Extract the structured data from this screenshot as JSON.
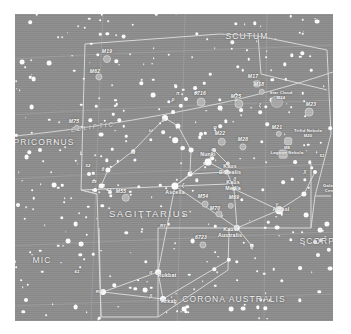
{
  "chart_data": {
    "type": "scatter",
    "subtitle": "",
    "xlabel": "",
    "ylabel": "",
    "grid": true,
    "legend": "none",
    "colors": {
      "sky_background": "#8d8d8d",
      "page_background": "#ffffff",
      "star": "#ffffff",
      "deep_sky_object": "#b4b4b4",
      "boundary_line": "#d8d8d8",
      "constellation_line": "#e4e4e4",
      "grid_line": "#a3a3a3",
      "label_text": "#ffffff"
    },
    "constellation_names": [
      {
        "name": "SCUTUM",
        "x": 232,
        "y": 22,
        "size": "normal"
      },
      {
        "name": "SAGITTARIUS",
        "x": 134,
        "y": 200,
        "size": "big"
      },
      {
        "name": "CAPRICORNUS",
        "x": 22,
        "y": 128,
        "size": "normal"
      },
      {
        "name": "MIC",
        "x": 27,
        "y": 246,
        "size": "normal"
      },
      {
        "name": "SCORPIUS",
        "x": 311,
        "y": 227,
        "size": "normal"
      },
      {
        "name": "CORONA AUSTRALIS",
        "x": 219,
        "y": 285,
        "size": "normal"
      }
    ],
    "ecliptic_label": "ECLIPTIC",
    "named_stars": [
      {
        "name": "Nunki",
        "x": 193,
        "y": 141
      },
      {
        "name": "Ascella",
        "x": 160,
        "y": 179
      },
      {
        "name": "Alnasl",
        "x": 266,
        "y": 196
      },
      {
        "name": "Rukbat",
        "x": 152,
        "y": 262
      },
      {
        "name": "Arkab",
        "x": 154,
        "y": 288
      },
      {
        "name": "Kaus Borealis",
        "x": 215,
        "y": 156
      },
      {
        "name": "Kaus Media",
        "x": 218,
        "y": 172
      },
      {
        "name": "Kaus Australis",
        "x": 215,
        "y": 219
      }
    ],
    "deep_sky_objects": [
      {
        "name": "M19",
        "x": 92,
        "y": 45,
        "type": "globular-cluster",
        "r": 3.0
      },
      {
        "name": "M62",
        "x": 84,
        "y": 63,
        "type": "globular-cluster",
        "r": 2.6
      },
      {
        "name": "M75",
        "x": 62,
        "y": 114,
        "type": "globular-cluster",
        "r": 2.2
      },
      {
        "name": "6716",
        "x": 186,
        "y": 88,
        "type": "open-cluster",
        "r": 3.4
      },
      {
        "name": "M25",
        "x": 224,
        "y": 90,
        "type": "open-cluster",
        "r": 3.6
      },
      {
        "name": "M17",
        "x": 242,
        "y": 70,
        "type": "nebula",
        "r": 2.6
      },
      {
        "name": "M18",
        "x": 247,
        "y": 78,
        "type": "open-cluster",
        "r": 2.2
      },
      {
        "name": "M24",
        "x": 262,
        "y": 88,
        "type": "star-cloud",
        "r": 5.2
      },
      {
        "name": "M23",
        "x": 294,
        "y": 98,
        "type": "open-cluster",
        "r": 3.4
      },
      {
        "name": "M21",
        "x": 264,
        "y": 120,
        "type": "open-cluster",
        "r": 2.2
      },
      {
        "name": "M20",
        "x": 273,
        "y": 127,
        "type": "nebula",
        "r": 2.8
      },
      {
        "name": "M8",
        "x": 268,
        "y": 140,
        "type": "nebula",
        "r": 3.4
      },
      {
        "name": "M28",
        "x": 228,
        "y": 133,
        "type": "globular-cluster",
        "r": 2.6
      },
      {
        "name": "M22",
        "x": 207,
        "y": 128,
        "type": "globular-cluster",
        "r": 3.2
      },
      {
        "name": "M54",
        "x": 190,
        "y": 190,
        "type": "globular-cluster",
        "r": 2.4
      },
      {
        "name": "M69",
        "x": 216,
        "y": 192,
        "type": "globular-cluster",
        "r": 2.2
      },
      {
        "name": "M70",
        "x": 204,
        "y": 200,
        "type": "globular-cluster",
        "r": 2.6
      },
      {
        "name": "M55",
        "x": 111,
        "y": 184,
        "type": "globular-cluster",
        "r": 3.2
      },
      {
        "name": "6723",
        "x": 188,
        "y": 231,
        "type": "globular-cluster",
        "r": 2.6
      }
    ],
    "dso_labels": [
      {
        "text": "M19",
        "x": 92,
        "y": 38,
        "style": "messier"
      },
      {
        "text": "M62",
        "x": 80,
        "y": 58,
        "style": "messier"
      },
      {
        "text": "M75",
        "x": 59,
        "y": 108,
        "style": "messier"
      },
      {
        "text": "6716",
        "x": 185,
        "y": 80,
        "style": "messier"
      },
      {
        "text": "M25",
        "x": 221,
        "y": 83,
        "style": "messier"
      },
      {
        "text": "M17",
        "x": 238,
        "y": 63,
        "style": "messier"
      },
      {
        "text": "M18",
        "x": 244,
        "y": 71,
        "style": "messier"
      },
      {
        "text": "M23",
        "x": 296,
        "y": 91,
        "style": "messier"
      },
      {
        "text": "M21",
        "x": 262,
        "y": 114,
        "style": "messier"
      },
      {
        "text": "M28",
        "x": 228,
        "y": 126,
        "style": "messier"
      },
      {
        "text": "M22",
        "x": 205,
        "y": 120,
        "style": "messier"
      },
      {
        "text": "M54",
        "x": 188,
        "y": 183,
        "style": "messier"
      },
      {
        "text": "M69",
        "x": 219,
        "y": 184,
        "style": "messier"
      },
      {
        "text": "M70",
        "x": 200,
        "y": 195,
        "style": "messier"
      },
      {
        "text": "M55",
        "x": 106,
        "y": 178,
        "style": "messier"
      },
      {
        "text": "6723",
        "x": 186,
        "y": 224,
        "style": "messier"
      }
    ],
    "nebula_labels": [
      {
        "line1": "Star Cloud",
        "line2": "M24",
        "x": 266,
        "y": 82
      },
      {
        "line1": "Trifid Nebula",
        "line2": "M20",
        "x": 293,
        "y": 120
      },
      {
        "line1": "M8",
        "line2": "Lagoon Nebula",
        "x": 272,
        "y": 137
      },
      {
        "line1": "Galactic",
        "line2": "Center",
        "x": 317,
        "y": 175
      }
    ],
    "greek_letters": [
      {
        "ch": "π",
        "x": 163,
        "y": 80
      },
      {
        "ch": "ρ",
        "x": 158,
        "y": 86
      },
      {
        "ch": "υ",
        "x": 148,
        "y": 107
      },
      {
        "ch": "ω",
        "x": 136,
        "y": 117
      },
      {
        "ch": "τ",
        "x": 176,
        "y": 159
      },
      {
        "ch": "ζ",
        "x": 168,
        "y": 172
      },
      {
        "ch": "σ",
        "x": 198,
        "y": 136
      },
      {
        "ch": "λ",
        "x": 213,
        "y": 150
      },
      {
        "ch": "δ",
        "x": 220,
        "y": 166
      },
      {
        "ch": "ε",
        "x": 222,
        "y": 213
      },
      {
        "ch": "γ",
        "x": 262,
        "y": 191
      },
      {
        "ch": "μ",
        "x": 221,
        "y": 86
      },
      {
        "ch": "ξ",
        "x": 245,
        "y": 92
      },
      {
        "ch": "η",
        "x": 237,
        "y": 234
      },
      {
        "ch": "θ",
        "x": 88,
        "y": 156
      },
      {
        "ch": "ι",
        "x": 84,
        "y": 175
      },
      {
        "ch": "α",
        "x": 136,
        "y": 259
      },
      {
        "ch": "β",
        "x": 136,
        "y": 283
      },
      {
        "ch": "φ",
        "x": 200,
        "y": 114
      },
      {
        "ch": "χ",
        "x": 290,
        "y": 158
      }
    ],
    "small_labels": [
      {
        "text": "51",
        "x": 118,
        "y": 139
      },
      {
        "text": "52",
        "x": 73,
        "y": 152
      },
      {
        "text": "59",
        "x": 79,
        "y": 168
      },
      {
        "text": "62",
        "x": 94,
        "y": 176
      },
      {
        "text": "61",
        "x": 62,
        "y": 258
      },
      {
        "text": "RU",
        "x": 84,
        "y": 278
      },
      {
        "text": "RY",
        "x": 148,
        "y": 212
      },
      {
        "text": "51",
        "x": 307,
        "y": 142
      }
    ]
  }
}
